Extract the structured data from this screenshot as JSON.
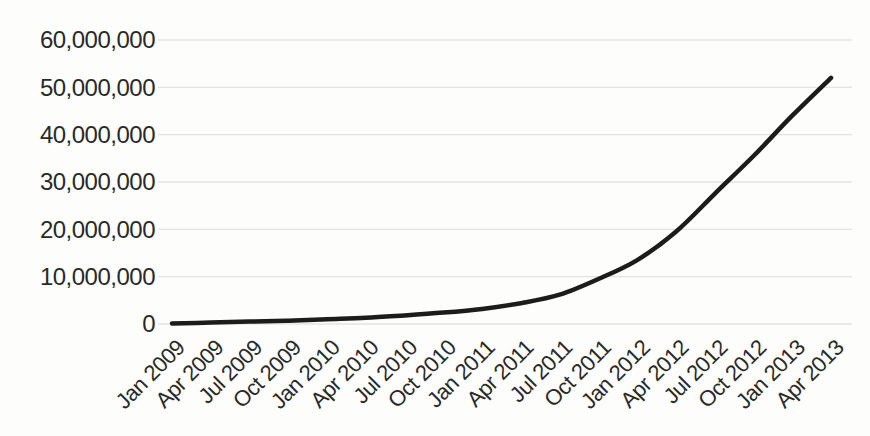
{
  "chart_data": {
    "type": "line",
    "title": "",
    "xlabel": "",
    "ylabel": "",
    "legend": "none",
    "grid": "horizontal",
    "categories": [
      "Jan 2009",
      "Apr 2009",
      "Jul 2009",
      "Oct 2009",
      "Jan 2010",
      "Apr 2010",
      "Jul 2010",
      "Oct 2010",
      "Jan 2011",
      "Apr 2011",
      "Jul 2011",
      "Oct 2011",
      "Jan 2012",
      "Apr 2012",
      "Jul 2012",
      "Oct 2012",
      "Jan 2013",
      "Apr 2013"
    ],
    "values": [
      100000,
      300000,
      500000,
      700000,
      1000000,
      1300000,
      1800000,
      2400000,
      3200000,
      4400000,
      6200000,
      9500000,
      13500000,
      19500000,
      27500000,
      35500000,
      44000000,
      52000000
    ],
    "ylim": [
      0,
      60000000
    ],
    "ytick_step": 10000000,
    "ytick_values": [
      0,
      10000000,
      20000000,
      30000000,
      40000000,
      50000000,
      60000000
    ],
    "ytick_labels": [
      "0",
      "10,000,000",
      "20,000,000",
      "30,000,000",
      "40,000,000",
      "50,000,000",
      "60,000,000"
    ],
    "x_tick_rotation_deg": -45,
    "colors": {
      "line": "#1c1c1a",
      "grid": "#e3e3e0",
      "label": "#2a2a28",
      "background": "#fdfdfb"
    },
    "line_width": 4.5
  }
}
